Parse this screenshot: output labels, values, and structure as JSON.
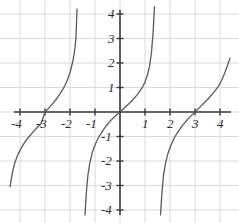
{
  "chart_data": {
    "type": "line",
    "title": "",
    "subtitle": "",
    "xlabel": "",
    "ylabel": "",
    "function": "tangent",
    "xlim": [
      -4.5,
      4.5
    ],
    "ylim": [
      -4.5,
      4.5
    ],
    "grid": true,
    "grid_spacing": 1,
    "legend": "none",
    "x_ticks": [
      -4,
      -3,
      -2,
      -1,
      1,
      2,
      3,
      4
    ],
    "y_ticks": [
      -4,
      -3,
      -2,
      -1,
      1,
      2,
      3,
      4
    ],
    "x_tick_labels": [
      "-4",
      "-3",
      "-2",
      "-1",
      "1",
      "2",
      "3",
      "4"
    ],
    "y_tick_labels": [
      "-4",
      "-3",
      "-2",
      "-1",
      "1",
      "2",
      "3",
      "4"
    ],
    "zeros": [
      -3,
      0,
      3
    ],
    "asymptotes": [
      -4.55,
      -1.45,
      1.45,
      4.55
    ],
    "period": 3,
    "series": [
      {
        "name": "branch-left",
        "x": [
          -4.4,
          -4.3,
          -4.2,
          -4.1,
          -4.0,
          -3.9,
          -3.8,
          -3.7,
          -3.6,
          -3.45,
          -3.3,
          -3.15,
          -3.0,
          -2.85,
          -2.7,
          -2.55,
          -2.4,
          -2.3,
          -2.2,
          -2.1,
          -2.0,
          -1.9,
          -1.82,
          -1.76,
          -1.72
        ],
        "y": [
          -3.05,
          -2.45,
          -2.05,
          -1.78,
          -1.56,
          -1.38,
          -1.22,
          -1.08,
          -0.96,
          -0.78,
          -0.62,
          -0.46,
          0.0,
          0.16,
          0.33,
          0.52,
          0.74,
          0.9,
          1.09,
          1.32,
          1.61,
          2.01,
          2.45,
          3.05,
          4.2
        ]
      },
      {
        "name": "branch-middle",
        "x": [
          -1.4,
          -1.34,
          -1.28,
          -1.2,
          -1.1,
          -1.0,
          -0.9,
          -0.8,
          -0.7,
          -0.55,
          -0.4,
          -0.25,
          0.0,
          0.2,
          0.4,
          0.55,
          0.7,
          0.8,
          0.9,
          1.0,
          1.1,
          1.18,
          1.26,
          1.32,
          1.38
        ],
        "y": [
          -4.2,
          -3.2,
          -2.55,
          -2.05,
          -1.62,
          -1.35,
          -1.12,
          -0.94,
          -0.78,
          -0.56,
          -0.38,
          -0.22,
          0.0,
          0.19,
          0.38,
          0.54,
          0.72,
          0.86,
          1.02,
          1.22,
          1.52,
          1.85,
          2.45,
          3.2,
          4.3
        ]
      },
      {
        "name": "branch-right",
        "x": [
          1.62,
          1.68,
          1.74,
          1.82,
          1.92,
          2.02,
          2.12,
          2.22,
          2.32,
          2.47,
          2.62,
          2.77,
          3.0,
          3.18,
          3.36,
          3.52,
          3.68,
          3.8,
          3.92,
          4.02,
          4.12,
          4.2,
          4.28,
          4.34,
          4.4
        ],
        "y": [
          -4.2,
          -3.25,
          -2.6,
          -2.1,
          -1.68,
          -1.4,
          -1.16,
          -0.97,
          -0.81,
          -0.59,
          -0.4,
          -0.23,
          0.0,
          0.18,
          0.37,
          0.53,
          0.72,
          0.86,
          1.03,
          1.2,
          1.42,
          1.62,
          1.85,
          2.02,
          2.2
        ]
      }
    ],
    "style": {
      "curve_color": "#5a5a5a",
      "axis_color": "#3a3a3a",
      "grid_color": "#d9d9e2",
      "label_color": "#2b2b2b",
      "background": "#ffffff"
    }
  },
  "axes": {
    "x_labels": [
      {
        "text": "-4",
        "x": -4
      },
      {
        "text": "-3",
        "x": -3
      },
      {
        "text": "-2",
        "x": -2
      },
      {
        "text": "-1",
        "x": -1
      },
      {
        "text": "1",
        "x": 1
      },
      {
        "text": "2",
        "x": 2
      },
      {
        "text": "3",
        "x": 3
      },
      {
        "text": "4",
        "x": 4
      }
    ],
    "y_labels": [
      {
        "text": "4",
        "y": 4
      },
      {
        "text": "3",
        "y": 3
      },
      {
        "text": "2",
        "y": 2
      },
      {
        "text": "1",
        "y": 1
      },
      {
        "text": "-1",
        "y": -1
      },
      {
        "text": "-2",
        "y": -2
      },
      {
        "text": "-3",
        "y": -3
      },
      {
        "text": "-4",
        "y": -4
      }
    ]
  }
}
